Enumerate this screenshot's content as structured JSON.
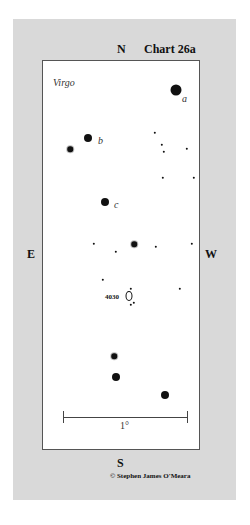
{
  "chart": {
    "title": "Chart 26a",
    "constellation": "Virgo",
    "directions": {
      "north": "N",
      "south": "S",
      "east": "E",
      "west": "W"
    },
    "object_label": "4030",
    "scale_label": "1°",
    "copyright": "© Stephen James O'Meara",
    "star_labels": {
      "a": "a",
      "b": "b",
      "c": "c"
    }
  }
}
